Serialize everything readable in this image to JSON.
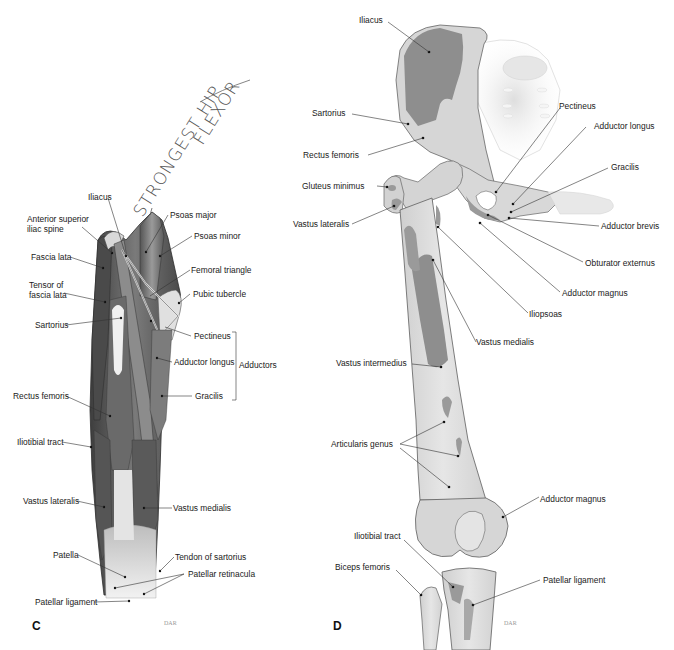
{
  "figure": {
    "panels": [
      {
        "letter": "C",
        "credit": "DAR",
        "handwritten_note": {
          "line1": "STRONGEST HIP",
          "line2": "FLEXOR"
        },
        "labels": {
          "iliacus": "Iliacus",
          "asis": "Anterior superior\niliac spine",
          "psoas_major": "Psoas major",
          "psoas_minor": "Psoas minor",
          "fascia_lata": "Fascia lata",
          "femoral_triangle": "Femoral triangle",
          "tensor_fascia_lata": "Tensor of\nfascia lata",
          "pubic_tubercle": "Pubic tubercle",
          "sartorius": "Sartorius",
          "pectineus": "Pectineus",
          "adductor_longus": "Adductor longus",
          "gracilis": "Gracilis",
          "rectus_femoris": "Rectus femoris",
          "iliotibial_tract": "Iliotibial tract",
          "vastus_lateralis": "Vastus lateralis",
          "vastus_medialis": "Vastus medialis",
          "patella": "Patella",
          "tendon_sartorius": "Tendon of sartorius",
          "patellar_retinacula": "Patellar retinacula",
          "patellar_ligament": "Patellar ligament"
        },
        "group_label": "Adductors"
      },
      {
        "letter": "D",
        "credit": "DAR",
        "labels": {
          "iliacus": "Iliacus",
          "sartorius": "Sartorius",
          "pectineus": "Pectineus",
          "adductor_longus": "Adductor longus",
          "rectus_femoris": "Rectus femoris",
          "gracilis": "Gracilis",
          "gluteus_minimus": "Gluteus minimus",
          "adductor_brevis": "Adductor brevis",
          "vastus_lateralis": "Vastus lateralis",
          "obturator_externus": "Obturator externus",
          "adductor_magnus_upper": "Adductor magnus",
          "iliopsoas": "Iliopsoas",
          "vastus_medialis": "Vastus medialis",
          "vastus_intermedius": "Vastus intermedius",
          "articularis_genus": "Articularis genus",
          "adductor_magnus_lower": "Adductor magnus",
          "iliotibial_tract": "Iliotibial tract",
          "biceps_femoris": "Biceps femoris",
          "patellar_ligament": "Patellar ligament"
        }
      }
    ],
    "colors": {
      "muscle_dark": "#5a5a5a",
      "muscle_mid": "#8a8a8a",
      "tendon_light": "#e8e8e8",
      "bone": "#dcdcdc",
      "bone_outline": "#6e6e6e",
      "attachment": "#8c8c8c",
      "leader": "#333333",
      "text": "#1a1a1a"
    }
  }
}
